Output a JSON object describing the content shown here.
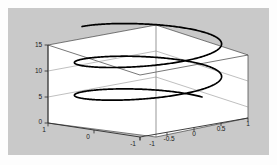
{
  "figure": {
    "background_color": "#c9c9c9",
    "page_color": "#fdfdfd",
    "axes_wall_color": "#ffffff",
    "axes_line_color": "#3c3c3c",
    "curve_color": "#000000"
  },
  "chart_data": {
    "type": "line",
    "title": "",
    "subtitle": "",
    "projection": "3d",
    "xlabel": "",
    "ylabel": "",
    "zlabel": "",
    "grid": false,
    "legend": null,
    "annotations": [],
    "xlim": [
      -1,
      1
    ],
    "ylim": [
      -1,
      1
    ],
    "zlim": [
      0,
      15
    ],
    "xticks": [
      -1,
      -0.5,
      0,
      0.5,
      1
    ],
    "yticks": [
      -1,
      0,
      1
    ],
    "zticks": [
      0,
      5,
      10,
      15
    ],
    "xticklabels": [
      "-1",
      "-0.5",
      "0",
      "0.5",
      "1"
    ],
    "yticklabels": [
      "-1",
      "0",
      "1"
    ],
    "zticklabels": [
      "0",
      "5",
      "10",
      "15"
    ],
    "series": [
      {
        "name": "helix",
        "description": "parametric helix x=cos(t), y=sin(t), z=t over t in [0, 14.5]",
        "parametric": {
          "x": "cos(t)",
          "y": "sin(t)",
          "z": "t",
          "t_start": 0,
          "t_end": 14.5,
          "turns": 2.3
        },
        "marker": "dot",
        "linewidth": 1.6,
        "color": "#000000"
      }
    ]
  },
  "axis_labels": {
    "z": [
      {
        "text": "15",
        "value": 15
      },
      {
        "text": "10",
        "value": 10
      },
      {
        "text": "5",
        "value": 5
      },
      {
        "text": "0",
        "value": 0
      }
    ],
    "y_front_left": [
      {
        "text": "1",
        "value": 1
      },
      {
        "text": "0",
        "value": 0
      },
      {
        "text": "-1",
        "value": -1
      }
    ],
    "x_front_right": [
      {
        "text": "-1",
        "value": -1
      },
      {
        "text": "-0.5",
        "value": -0.5
      },
      {
        "text": "0",
        "value": 0
      },
      {
        "text": "0.5",
        "value": 0.5
      },
      {
        "text": "1",
        "value": 1
      }
    ]
  }
}
